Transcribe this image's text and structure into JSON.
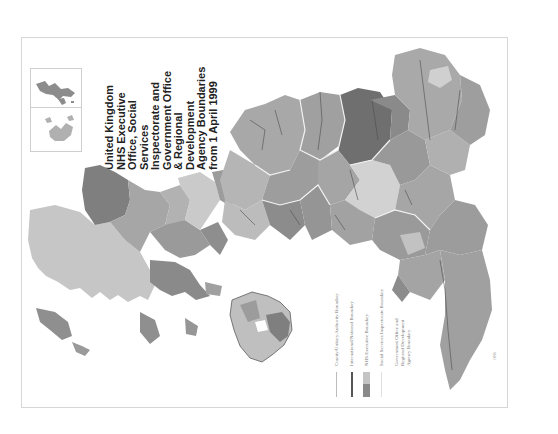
{
  "title": {
    "lines": [
      "United Kingdom",
      "NHS Executive",
      "Office, Social",
      "Services",
      "Inspectorate and",
      "Government Office",
      "& Regional",
      "Development",
      "Agency Boundaries",
      "from 1 April 1999"
    ],
    "text": "United Kingdom\nNHS Executive\nOffice, Social\nServices\nInspectorate and\nGovernment Office\n& Regional\nDevelopment\nAgency Boundaries\nfrom 1 April 1999"
  },
  "legend": {
    "items": [
      {
        "label": "County/Unitary Authority Boundary",
        "symbol": "thin-line",
        "color": "#b8b8b8"
      },
      {
        "label": "International/National Boundary",
        "symbol": "thick-line",
        "color": "#555555"
      },
      {
        "label": "NHS Executive Boundary",
        "symbol": "two-tone-swatch",
        "colors": [
          "#c4c4c4",
          "#8a8a8a"
        ]
      },
      {
        "label": "Social Services Inspectorate Boundary",
        "symbol": "white-line",
        "color": "#e6e6e6"
      },
      {
        "label": "Government Office and Regional Development Agency Boundary",
        "symbol": "none"
      }
    ]
  },
  "map": {
    "region": "United Kingdom",
    "orientation": "rotated 90° counter-clockwise",
    "insets": [
      "Shetland Islands",
      "Orkney Islands"
    ],
    "colors": {
      "dark": "#7a7a7a",
      "mid_dark": "#8f8f8f",
      "mid": "#a3a3a3",
      "light": "#bdbdbd",
      "lighter": "#cfcfcf",
      "border_white": "#f0f0f0",
      "border_dark": "#4a4a4a"
    }
  },
  "footer": {
    "mark": "ONS"
  }
}
